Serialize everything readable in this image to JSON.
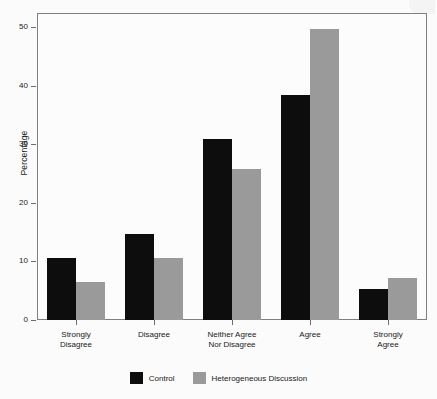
{
  "chart_data": {
    "type": "bar",
    "title": "",
    "subtitle": "",
    "xlabel": "",
    "ylabel": "Percentage",
    "categories": [
      "Strongly\nDisagree",
      "Disagree",
      "Neither Agree\nNor Disagree",
      "Agree",
      "Strongly\nAgree"
    ],
    "category_lines": [
      [
        "Strongly",
        "Disagree"
      ],
      [
        "Disagree",
        ""
      ],
      [
        "Neither Agree",
        "Nor Disagree"
      ],
      [
        "Agree",
        ""
      ],
      [
        "Strongly",
        "Agree"
      ]
    ],
    "series": [
      {
        "name": "Control",
        "color": "#0d0d0d",
        "values": [
          10.6,
          14.7,
          30.9,
          38.4,
          5.3
        ]
      },
      {
        "name": "Heterogeneous Discussion",
        "color": "#9a9a9a",
        "values": [
          6.5,
          10.5,
          25.8,
          49.6,
          7.1
        ]
      }
    ],
    "ylim": [
      0,
      52
    ],
    "yticks": [
      0,
      10,
      20,
      30,
      40,
      50
    ],
    "ytick_labels": [
      "0",
      "10",
      "20",
      "30",
      "40",
      "50"
    ],
    "grid": false,
    "legend_position": "bottom",
    "legend_entries": [
      {
        "label": "Control",
        "color": "#0d0d0d"
      },
      {
        "label": "Heterogeneous Discussion",
        "color": "#9a9a9a"
      }
    ]
  }
}
